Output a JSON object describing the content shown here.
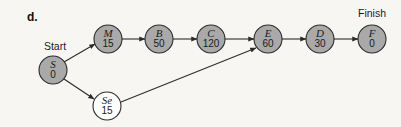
{
  "figure": {
    "part_label": "d.",
    "type": "activity-on-node project network diagram",
    "background_color": "#f8f6f3",
    "node_fill_shaded": "#a9a9a9",
    "node_fill_plain": "#ffffff",
    "stroke_color": "#2b2b2b"
  },
  "annotations": [
    {
      "id": "start-label",
      "text": "Start",
      "x": 55,
      "y": 47
    },
    {
      "id": "finish-label",
      "text": "Finish",
      "x": 372,
      "y": 14
    }
  ],
  "nodes": [
    {
      "id": "S",
      "letter": "S",
      "value": "0",
      "x": 53,
      "y": 70,
      "r": 14,
      "shaded": true
    },
    {
      "id": "M",
      "letter": "M",
      "value": "15",
      "x": 108,
      "y": 39,
      "r": 14,
      "shaded": true
    },
    {
      "id": "B",
      "letter": "B",
      "value": "50",
      "x": 159,
      "y": 39,
      "r": 14,
      "shaded": true
    },
    {
      "id": "C",
      "letter": "C",
      "value": "120",
      "x": 211,
      "y": 39,
      "r": 14,
      "shaded": true
    },
    {
      "id": "E",
      "letter": "E",
      "value": "60",
      "x": 268,
      "y": 39,
      "r": 14,
      "shaded": true
    },
    {
      "id": "D",
      "letter": "D",
      "value": "30",
      "x": 320,
      "y": 39,
      "r": 14,
      "shaded": true
    },
    {
      "id": "F",
      "letter": "F",
      "value": "0",
      "x": 372,
      "y": 39,
      "r": 14,
      "shaded": true
    },
    {
      "id": "Se",
      "letter": "Se",
      "value": "15",
      "x": 107,
      "y": 106,
      "r": 14,
      "shaded": false
    }
  ],
  "edges": [
    {
      "id": "S-M",
      "from": "S",
      "to": "M",
      "x1": 64,
      "y1": 62,
      "x2": 95,
      "y2": 44
    },
    {
      "id": "S-Se",
      "from": "S",
      "to": "Se",
      "x1": 64,
      "y1": 79,
      "x2": 94,
      "y2": 99
    },
    {
      "id": "M-B",
      "from": "M",
      "to": "B",
      "x1": 122,
      "y1": 39,
      "x2": 145,
      "y2": 39
    },
    {
      "id": "B-C",
      "from": "B",
      "to": "C",
      "x1": 173,
      "y1": 39,
      "x2": 197,
      "y2": 39
    },
    {
      "id": "C-E",
      "from": "C",
      "to": "E",
      "x1": 225,
      "y1": 39,
      "x2": 254,
      "y2": 39
    },
    {
      "id": "Se-E",
      "from": "Se",
      "to": "E",
      "x1": 121,
      "y1": 102,
      "x2": 256,
      "y2": 48
    },
    {
      "id": "E-D",
      "from": "E",
      "to": "D",
      "x1": 282,
      "y1": 39,
      "x2": 306,
      "y2": 39
    },
    {
      "id": "D-F",
      "from": "D",
      "to": "F",
      "x1": 334,
      "y1": 39,
      "x2": 358,
      "y2": 39
    }
  ]
}
